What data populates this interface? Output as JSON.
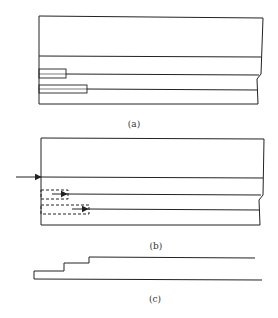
{
  "figure": {
    "panels": [
      {
        "id": "a",
        "label": "(a)"
      },
      {
        "id": "b",
        "label": "(b)"
      },
      {
        "id": "c",
        "label": "(c)"
      }
    ]
  },
  "colors": {
    "stroke": "#222222",
    "background": "#ffffff"
  }
}
